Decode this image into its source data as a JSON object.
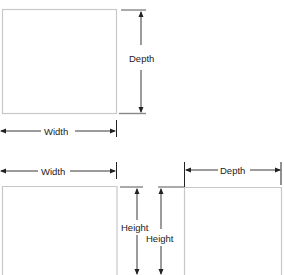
{
  "diagram": {
    "top_view": {
      "depth_label": "Depth",
      "width_label": "Width"
    },
    "front_view": {
      "width_label": "Width",
      "height_label_outer": "Height",
      "height_label_inner": "Height"
    },
    "side_view": {
      "depth_label": "Depth"
    },
    "colors": {
      "box_outline": "#c8c8c8",
      "dimension_line": "#222222"
    }
  }
}
